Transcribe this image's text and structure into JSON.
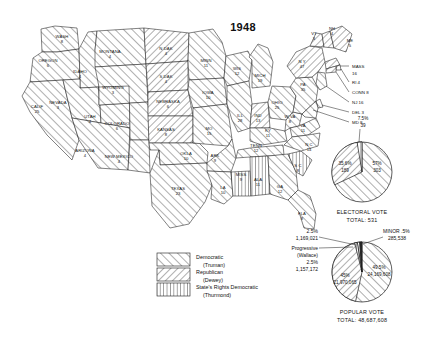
{
  "title": "1948",
  "map": {
    "name": "us-electoral-map-1948",
    "states": [
      {
        "code": "WASH",
        "label": "WASH",
        "votes": "8",
        "party": "democratic",
        "x": 62,
        "y": 38
      },
      {
        "code": "OREG",
        "label": "OREGON",
        "votes": "6",
        "party": "democratic",
        "x": 48,
        "y": 62
      },
      {
        "code": "CALIF",
        "label": "CALIF",
        "votes": "25",
        "party": "democratic",
        "x": 37,
        "y": 108
      },
      {
        "code": "IDAHO",
        "label": "IDAHO",
        "votes": "4",
        "party": "democratic",
        "x": 80,
        "y": 73
      },
      {
        "code": "NEV",
        "label": "NEVADA",
        "votes": "3",
        "party": "democratic",
        "x": 58,
        "y": 104
      },
      {
        "code": "UTAH",
        "label": "UTAH",
        "votes": "4",
        "party": "democratic",
        "x": 90,
        "y": 118
      },
      {
        "code": "ARIZ",
        "label": "ARIZONA",
        "votes": "4",
        "party": "democratic",
        "x": 85,
        "y": 152
      },
      {
        "code": "MONT",
        "label": "MONTANA",
        "votes": "4",
        "party": "democratic",
        "x": 110,
        "y": 53
      },
      {
        "code": "WYO",
        "label": "WYOMING",
        "votes": "3",
        "party": "democratic",
        "x": 113,
        "y": 89
      },
      {
        "code": "COLO",
        "label": "COLORADO",
        "votes": "6",
        "party": "democratic",
        "x": 117,
        "y": 125
      },
      {
        "code": "NMEX",
        "label": "NEW MEXICO",
        "votes": "4",
        "party": "democratic",
        "x": 119,
        "y": 158
      },
      {
        "code": "NDAK",
        "label": "N DAK",
        "votes": "4",
        "party": "republican",
        "x": 166,
        "y": 50
      },
      {
        "code": "SDAK",
        "label": "S DAK",
        "votes": "4",
        "party": "republican",
        "x": 166,
        "y": 78
      },
      {
        "code": "NEBR",
        "label": "NEBRASKA",
        "votes": "6",
        "party": "republican",
        "x": 168,
        "y": 103
      },
      {
        "code": "KANS",
        "label": "KANSAS",
        "votes": "8",
        "party": "republican",
        "x": 166,
        "y": 131
      },
      {
        "code": "OKLA",
        "label": "OKLA",
        "votes": "10",
        "party": "democratic",
        "x": 186,
        "y": 155
      },
      {
        "code": "TEXAS",
        "label": "TEXAS",
        "votes": "23",
        "party": "democratic",
        "x": 178,
        "y": 190
      },
      {
        "code": "MINN",
        "label": "MINN",
        "votes": "11",
        "party": "democratic",
        "x": 206,
        "y": 62
      },
      {
        "code": "IOWA",
        "label": "IOWA",
        "votes": "10",
        "party": "democratic",
        "x": 208,
        "y": 94
      },
      {
        "code": "MO",
        "label": "MO",
        "votes": "15",
        "party": "democratic",
        "x": 209,
        "y": 130
      },
      {
        "code": "ARK",
        "label": "ARK",
        "votes": "9",
        "party": "democratic",
        "x": 215,
        "y": 157
      },
      {
        "code": "LA",
        "label": "LA",
        "votes": "10",
        "party": "democratic",
        "x": 223,
        "y": 189
      },
      {
        "code": "WIS",
        "label": "WIS",
        "votes": "12",
        "party": "democratic",
        "x": 237,
        "y": 70
      },
      {
        "code": "ILL",
        "label": "ILL",
        "votes": "28",
        "party": "democratic",
        "x": 240,
        "y": 117
      },
      {
        "code": "MISS",
        "label": "MISS",
        "votes": "9",
        "party": "statesrights",
        "x": 241,
        "y": 176
      },
      {
        "code": "MICH",
        "label": "MICH",
        "votes": "19",
        "party": "democratic",
        "x": 260,
        "y": 77
      },
      {
        "code": "IND",
        "label": "IND",
        "votes": "13",
        "party": "republican",
        "x": 258,
        "y": 117
      },
      {
        "code": "TENN",
        "label": "TENN",
        "votes": "12",
        "party": "democratic",
        "x": 256,
        "y": 147
      },
      {
        "code": "ALA",
        "label": "ALA",
        "votes": "11",
        "party": "statesrights",
        "x": 258,
        "y": 181
      },
      {
        "code": "KY",
        "label": "KY",
        "votes": "11",
        "party": "democratic",
        "x": 268,
        "y": 132
      },
      {
        "code": "OHIO",
        "label": "OHIO",
        "votes": "25",
        "party": "democratic",
        "x": 277,
        "y": 104
      },
      {
        "code": "GA",
        "label": "GA",
        "votes": "12",
        "party": "democratic",
        "x": 280,
        "y": 188
      },
      {
        "code": "WVA",
        "label": "W VA",
        "votes": "8",
        "party": "democratic",
        "x": 290,
        "y": 118
      },
      {
        "code": "FLA",
        "label": "FLA",
        "votes": "8",
        "party": "democratic",
        "x": 302,
        "y": 215
      },
      {
        "code": "SC",
        "label": "S C",
        "votes": "8",
        "party": "statesrights",
        "x": 298,
        "y": 167
      },
      {
        "code": "VA",
        "label": "VA",
        "votes": "11",
        "party": "democratic",
        "x": 303,
        "y": 127
      },
      {
        "code": "NC",
        "label": "N C",
        "votes": "14",
        "party": "democratic",
        "x": 309,
        "y": 146
      },
      {
        "code": "PA",
        "label": "PA",
        "votes": "35",
        "party": "democratic",
        "x": 303,
        "y": 86
      },
      {
        "code": "NY",
        "label": "N Y",
        "votes": "47",
        "party": "republican",
        "x": 302,
        "y": 63
      },
      {
        "code": "VT",
        "label": "VT",
        "votes": "3",
        "party": "republican",
        "x": 314,
        "y": 35
      },
      {
        "code": "NH",
        "label": "NH",
        "votes": "4",
        "party": "republican",
        "x": 332,
        "y": 30
      },
      {
        "code": "ME",
        "label": "ME",
        "votes": "5",
        "party": "republican",
        "x": 350,
        "y": 42
      }
    ],
    "callouts": [
      {
        "name": "mass",
        "label": "MASS",
        "votes": "16",
        "x": 352,
        "y": 68
      },
      {
        "name": "ri",
        "label": "RI 4",
        "votes": "",
        "x": 352,
        "y": 84
      },
      {
        "name": "conn",
        "label": "CONN 8",
        "votes": "",
        "x": 352,
        "y": 94
      },
      {
        "name": "nj",
        "label": "NJ 16",
        "votes": "",
        "x": 352,
        "y": 104
      },
      {
        "name": "del",
        "label": "DEL 3",
        "votes": "",
        "x": 352,
        "y": 114
      },
      {
        "name": "md",
        "label": "MD 8",
        "votes": "",
        "x": 352,
        "y": 124
      }
    ]
  },
  "legend": {
    "name": "map-legend",
    "items": [
      {
        "pattern": "democratic",
        "line1": "Democratic",
        "line2": "(Truman)"
      },
      {
        "pattern": "republican",
        "line1": "Republican",
        "line2": "(Dewey)"
      },
      {
        "pattern": "statesrights",
        "line1": "State's Rights Democratic",
        "line2": "(Thurmond)"
      }
    ]
  },
  "chart_data": [
    {
      "type": "pie",
      "name": "electoral-vote-pie",
      "title": "ELECTORAL VOTE",
      "subtitle": "TOTAL: 531",
      "categories": [
        "Democratic (Truman)",
        "Republican (Dewey)",
        "State's Rights (Thurmond)"
      ],
      "values": [
        303,
        189,
        39
      ],
      "percents": [
        "57%",
        "35.6%",
        "7.5%"
      ],
      "labels": [
        {
          "pct": "57%",
          "count": "303",
          "party": "democratic",
          "placement": "inside-right"
        },
        {
          "pct": "35.6%",
          "count": "189",
          "party": "republican",
          "placement": "inside-left"
        },
        {
          "pct": "7.5%",
          "count": "39",
          "party": "statesrights",
          "placement": "outside-top"
        }
      ]
    },
    {
      "type": "pie",
      "name": "popular-vote-pie",
      "title": "POPULAR VOTE",
      "subtitle": "TOTAL: 48,687,608",
      "categories": [
        "Democratic (Truman)",
        "Republican (Dewey)",
        "State's Rights (Thurmond)",
        "Progressive (Wallace)",
        "Minor"
      ],
      "values": [
        24169608,
        21970065,
        1169021,
        1157172,
        285538
      ],
      "percents": [
        "49.5%",
        "45%",
        "2.5%",
        "2.5%",
        ".5%"
      ],
      "labels": [
        {
          "pct": "49.5%",
          "count": "24,169,608",
          "party": "democratic",
          "placement": "inside-right"
        },
        {
          "pct": "45%",
          "count": "21,970,065",
          "party": "republican",
          "placement": "inside-left"
        },
        {
          "pct": "2.5%",
          "count": "1,169,021",
          "party": "statesrights",
          "placement": "callout-upper-left"
        },
        {
          "pct": "2.5%",
          "count": "1,157,172",
          "party": "progressive",
          "placement": "callout-left",
          "name": "Progressive",
          "sub": "(Wallace)"
        },
        {
          "pct": ".5%",
          "count": "285,538",
          "party": "minor",
          "placement": "callout-upper-right",
          "name": "MINOR"
        }
      ]
    }
  ]
}
